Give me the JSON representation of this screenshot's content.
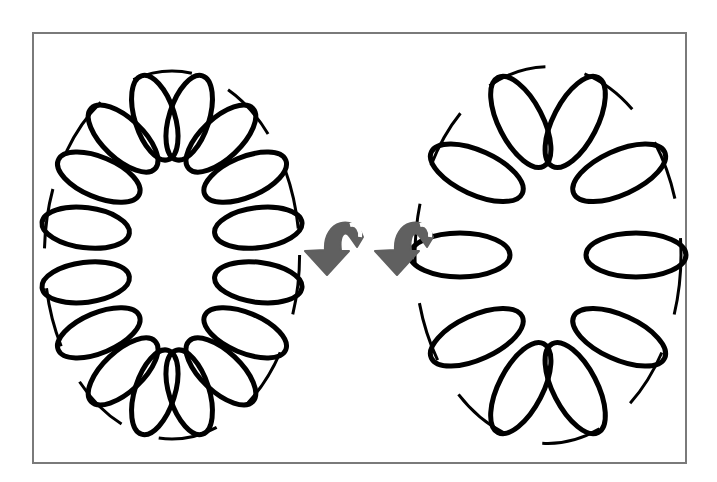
{
  "figure": {
    "frame": {
      "x": 32,
      "y": 32,
      "w": 655,
      "h": 432,
      "border_color": "#7a7a7a"
    },
    "coils": [
      {
        "id": "tight-coil",
        "label": "tightly wound toroidal coil",
        "cx": 172,
        "cy": 255,
        "ring_rx": 88,
        "ring_ry": 140,
        "loop_count": 16,
        "loop_rx": 44,
        "loop_ry": 20,
        "stroke": "#000000",
        "stroke_width": 5
      },
      {
        "id": "loose-coil",
        "label": "loosely wound toroidal coil",
        "cx": 548,
        "cy": 255,
        "ring_rx": 88,
        "ring_ry": 140,
        "loop_count": 10,
        "loop_rx": 50,
        "loop_ry": 22,
        "stroke": "#000000",
        "stroke_width": 5
      }
    ],
    "arrows": [
      {
        "id": "arrow-1",
        "x": 305,
        "y": 215,
        "color": "#606060"
      },
      {
        "id": "arrow-2",
        "x": 375,
        "y": 215,
        "color": "#606060"
      }
    ]
  }
}
